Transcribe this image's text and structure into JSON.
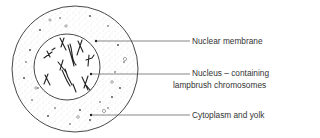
{
  "diagram": {
    "labels": [
      {
        "id": "membrane",
        "text": "Nuclear membrane"
      },
      {
        "id": "nucleus",
        "line1": "Nucleus – containing",
        "line2": "lampbrush chromosomes"
      },
      {
        "id": "cytoplasm",
        "text": "Cytoplasm and yolk"
      }
    ],
    "colors": {
      "stroke": "#333333",
      "stipple": "#555555",
      "background": "#ffffff"
    }
  }
}
